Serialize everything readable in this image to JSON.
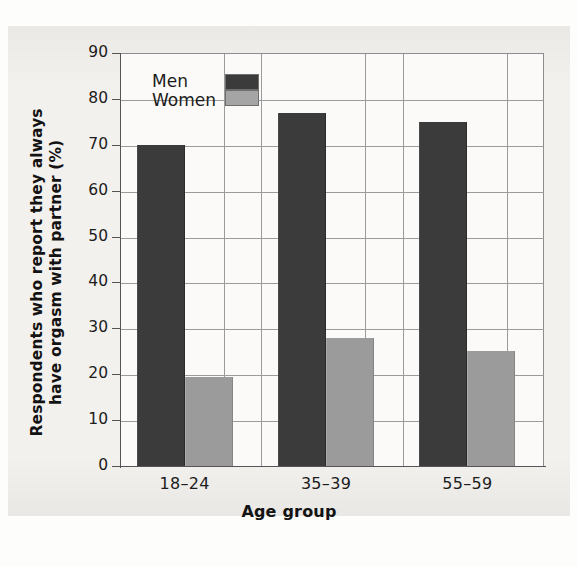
{
  "chart_data": {
    "type": "bar",
    "title": "",
    "xlabel": "Age group",
    "ylabel": "Respondents who report they always have orgasm with partner (%)",
    "ylabel_line1": "Respondents who report they always",
    "ylabel_line2": "have orgasm with partner (%)",
    "categories": [
      "18–24",
      "35–39",
      "55–59"
    ],
    "series": [
      {
        "name": "Men",
        "color": "#3b3b3b",
        "values": [
          70,
          77,
          75
        ]
      },
      {
        "name": "Women",
        "color": "#9b9b9b",
        "values": [
          19.5,
          28,
          25
        ]
      }
    ],
    "ylim": [
      0,
      90
    ],
    "ytick_step": 10,
    "yticks": [
      "90",
      "80",
      "70",
      "60",
      "50",
      "40",
      "30",
      "20",
      "10",
      "0"
    ],
    "grid": "horizontal-and-vertical",
    "legend_position": "top-left-inside"
  },
  "legend": {
    "items": [
      {
        "label": "Men",
        "swatch": "dark-gray"
      },
      {
        "label": "Women",
        "swatch": "light-gray"
      }
    ]
  },
  "axes": {
    "x_title": "Age group",
    "y_title_line1": "Respondents who report they always",
    "y_title_line2": "have orgasm with partner (%)"
  },
  "colors": {
    "men_bar": "#3b3b3b",
    "women_bar": "#9b9b9b",
    "grid": "#9b9b9b",
    "axis": "#555555",
    "page_background": "#f3f1ee",
    "plot_background": "#fbfaf8"
  }
}
